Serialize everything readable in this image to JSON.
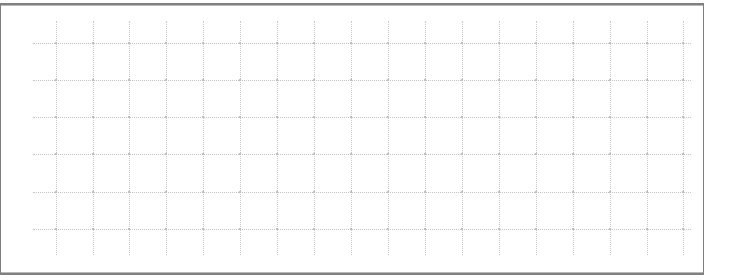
{
  "document": {
    "type": "empty-grid-table",
    "title": "",
    "background_color": "#ffffff"
  },
  "frame": {
    "name": "table-frame",
    "x": 0,
    "y": 3,
    "width": 704,
    "height": 272,
    "border_color": "#808080",
    "inner_rule_color": "#b9b9b9",
    "fill_color": "#ffffff"
  },
  "grid": {
    "line_style": "dotted",
    "row_rule_color": "#c4c4c4",
    "column_rule_color": "#c9c9c9",
    "node_color": "#bdbdbd",
    "row_count": 6,
    "column_count": 18,
    "cell_width": 37,
    "cell_height": 37,
    "row_rules_y": [
      41,
      78,
      115,
      152,
      190,
      227
    ],
    "row_rules_x_start": 32,
    "row_rules_x_end": 690,
    "column_rules_x": [
      55,
      92,
      128,
      165,
      202,
      239,
      276,
      313,
      350,
      387,
      424,
      461,
      498,
      535,
      572,
      609,
      646,
      682
    ],
    "column_rules_y_start": 19,
    "column_rules_y_end": 253
  },
  "cells": {
    "column_headers": [
      "",
      "",
      "",
      "",
      "",
      "",
      "",
      "",
      "",
      "",
      "",
      "",
      "",
      "",
      "",
      "",
      "",
      ""
    ],
    "rows": [
      {
        "label": "",
        "values": [
          "",
          "",
          "",
          "",
          "",
          "",
          "",
          "",
          "",
          "",
          "",
          "",
          "",
          "",
          "",
          "",
          "",
          ""
        ]
      },
      {
        "label": "",
        "values": [
          "",
          "",
          "",
          "",
          "",
          "",
          "",
          "",
          "",
          "",
          "",
          "",
          "",
          "",
          "",
          "",
          "",
          ""
        ]
      },
      {
        "label": "",
        "values": [
          "",
          "",
          "",
          "",
          "",
          "",
          "",
          "",
          "",
          "",
          "",
          "",
          "",
          "",
          "",
          "",
          "",
          ""
        ]
      },
      {
        "label": "",
        "values": [
          "",
          "",
          "",
          "",
          "",
          "",
          "",
          "",
          "",
          "",
          "",
          "",
          "",
          "",
          "",
          "",
          "",
          ""
        ]
      },
      {
        "label": "",
        "values": [
          "",
          "",
          "",
          "",
          "",
          "",
          "",
          "",
          "",
          "",
          "",
          "",
          "",
          "",
          "",
          "",
          "",
          ""
        ]
      },
      {
        "label": "",
        "values": [
          "",
          "",
          "",
          "",
          "",
          "",
          "",
          "",
          "",
          "",
          "",
          "",
          "",
          "",
          "",
          "",
          "",
          ""
        ]
      },
      {
        "label": "",
        "values": [
          "",
          "",
          "",
          "",
          "",
          "",
          "",
          "",
          "",
          "",
          "",
          "",
          "",
          "",
          "",
          "",
          "",
          ""
        ]
      }
    ]
  }
}
